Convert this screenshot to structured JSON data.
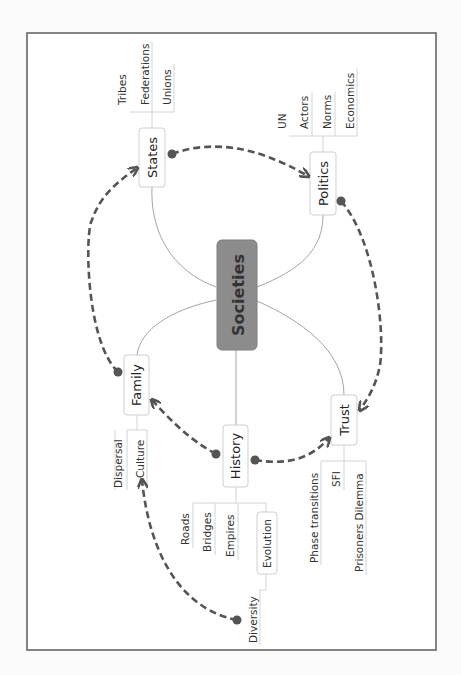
{
  "mindmap": {
    "root": {
      "label": "Societies"
    },
    "topics": {
      "states": {
        "label": "States",
        "children": [
          "Tribes",
          "Federations",
          "Unions"
        ]
      },
      "politics": {
        "label": "Politics",
        "children": [
          "UN",
          "Actors",
          "Norms",
          "Economics"
        ]
      },
      "family": {
        "label": "Family",
        "children": [
          "Culture"
        ]
      },
      "history": {
        "label": "History",
        "children": [
          "Roads",
          "Bridges",
          "Empires",
          "Evolution"
        ]
      },
      "trust": {
        "label": "Trust",
        "children": [
          "Phase transitions",
          "SFI",
          "Prisoners Dilemma"
        ]
      }
    },
    "subtopics": {
      "culture": {
        "label": "Culture",
        "children": [
          "Dispersal"
        ]
      },
      "evolution": {
        "label": "Evolution",
        "children": [
          "Diversity"
        ]
      }
    },
    "relationships": [
      {
        "from": "Family",
        "to": "States"
      },
      {
        "from": "States",
        "to": "Politics"
      },
      {
        "from": "Politics",
        "to": "Trust"
      },
      {
        "from": "History",
        "to": "Family"
      },
      {
        "from": "History",
        "to": "Trust"
      },
      {
        "from": "Diversity",
        "to": "Culture"
      }
    ],
    "orientation": "rotated 90° counter-clockwise"
  }
}
